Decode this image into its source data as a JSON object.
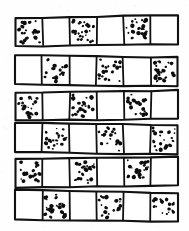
{
  "figure": {
    "kind": "hand-drawn-diagram",
    "background_color": "#fefefe",
    "ink_color": "#111111",
    "dot_color": "#0d0d0d",
    "canvas": {
      "width": 189,
      "height": 231
    },
    "row_count": 6,
    "cells_per_row": 6,
    "fill_states": [
      "stippled",
      "blank"
    ],
    "rows": [
      {
        "index": 1,
        "name": "strip-row-1",
        "starts_with": "stippled",
        "top": 16.5,
        "height": 29.0,
        "left": 15.5,
        "right": 178.0,
        "skew": {
          "left_top_dy": 1.6,
          "right_top_dy": -1.4,
          "left_bottom_dy": 1.0,
          "right_bottom_dy": -1.0
        },
        "cells": [
          "stippled",
          "blank",
          "stippled",
          "blank",
          "stippled",
          "blank"
        ]
      },
      {
        "index": 2,
        "name": "strip-row-2",
        "starts_with": "blank",
        "top": 56.0,
        "height": 29.0,
        "left": 15.0,
        "right": 177.5,
        "skew": {
          "left_top_dy": -0.8,
          "right_top_dy": 1.4,
          "left_bottom_dy": -0.6,
          "right_bottom_dy": 1.2
        },
        "cells": [
          "blank",
          "stippled",
          "blank",
          "stippled",
          "blank",
          "stippled"
        ]
      },
      {
        "index": 3,
        "name": "strip-row-3",
        "starts_with": "stippled",
        "top": 91.5,
        "height": 28.5,
        "left": 15.5,
        "right": 178.0,
        "skew": {
          "left_top_dy": 1.2,
          "right_top_dy": -1.2,
          "left_bottom_dy": 0.8,
          "right_bottom_dy": -1.4
        },
        "cells": [
          "stippled",
          "blank",
          "stippled",
          "blank",
          "stippled",
          "blank"
        ]
      },
      {
        "index": 4,
        "name": "strip-row-4",
        "starts_with": "blank",
        "top": 124.0,
        "height": 29.0,
        "left": 15.0,
        "right": 177.5,
        "skew": {
          "left_top_dy": -1.0,
          "right_top_dy": 1.0,
          "left_bottom_dy": -0.8,
          "right_bottom_dy": 1.4
        },
        "cells": [
          "blank",
          "stippled",
          "blank",
          "stippled",
          "blank",
          "stippled"
        ]
      },
      {
        "index": 5,
        "name": "strip-row-5",
        "starts_with": "stippled",
        "top": 157.5,
        "height": 29.0,
        "left": 15.5,
        "right": 178.0,
        "skew": {
          "left_top_dy": 1.4,
          "right_top_dy": -1.0,
          "left_bottom_dy": 1.0,
          "right_bottom_dy": -1.2
        },
        "cells": [
          "stippled",
          "blank",
          "stippled",
          "blank",
          "stippled",
          "blank"
        ]
      },
      {
        "index": 6,
        "name": "strip-row-6",
        "starts_with": "blank",
        "top": 191.0,
        "height": 29.5,
        "left": 15.0,
        "right": 178.0,
        "skew": {
          "left_top_dy": -1.4,
          "right_top_dy": 2.0,
          "left_bottom_dy": -0.6,
          "right_bottom_dy": 1.0
        },
        "cells": [
          "blank",
          "stippled",
          "blank",
          "stippled",
          "blank",
          "stippled"
        ]
      }
    ],
    "stipple": {
      "dots_per_cell_min": 17,
      "dots_per_cell_max": 26,
      "dot_radius_min": 0.8,
      "dot_radius_max": 2.3,
      "style": "irregular hand-inked blobs of varying size, denser toward cell interior"
    }
  }
}
